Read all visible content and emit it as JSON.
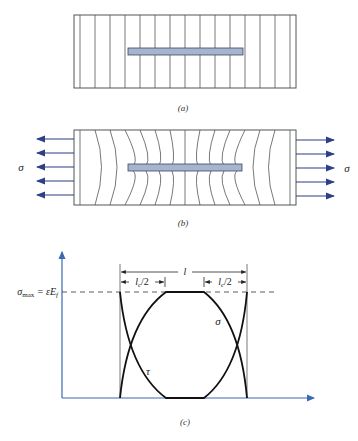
{
  "figure": {
    "panels": [
      {
        "id": "a",
        "caption": "(a)",
        "description": "Undeformed matrix with embedded fiber; uniform vertical grid lines"
      },
      {
        "id": "b",
        "caption": "(b)",
        "description": "Matrix under tensile stress; grid lines deform around fiber",
        "stress_label_left": "σ",
        "stress_label_right": "σ",
        "arrow_count_per_side": 5
      },
      {
        "id": "c",
        "caption": "(c)",
        "description": "Fiber tensile stress and interfacial shear stress distribution along fiber length"
      }
    ],
    "panel_c": {
      "y_label": "σmax = εEf",
      "y_label_parts": {
        "sigma": "σ",
        "sub": "max",
        "eq": " = εE",
        "sub2": "f"
      },
      "length_label": "l",
      "critical_half_left": "lc/2",
      "critical_half_right": "lc/2",
      "lc_parts": {
        "l": "l",
        "sub": "c",
        "rest": "/2"
      },
      "curve_labels": {
        "tensile": "σ",
        "shear": "τ"
      }
    },
    "colors": {
      "fiber_fill": "#a7b4d0",
      "fiber_stroke": "#3b4660",
      "arrow": "#2d3f86",
      "axis": "#3a6ab0",
      "grid_line": "#555555",
      "curve": "#111111"
    }
  }
}
